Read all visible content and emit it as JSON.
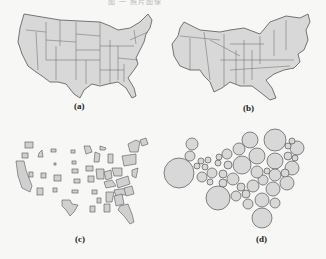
{
  "figure": {
    "caption_fragment": "图 一  照片图像",
    "panels": [
      {
        "id": "a",
        "label": "(a)",
        "description": "Original US state map"
      },
      {
        "id": "b",
        "label": "(b)",
        "description": "Contiguous (diffusion) cartogram"
      },
      {
        "id": "c",
        "label": "(c)",
        "description": "Non-contiguous cartogram"
      },
      {
        "id": "d",
        "label": "(d)",
        "description": "Dorling circle cartogram"
      }
    ]
  },
  "colors": {
    "fill": "#d8d8d8",
    "stroke": "#555555",
    "background": "#f7f7f5"
  },
  "dorling_circles": [
    [
      179,
      173,
      15
    ],
    [
      275,
      140,
      11
    ],
    [
      218,
      198,
      12
    ],
    [
      262,
      218,
      10
    ],
    [
      250,
      140,
      8
    ],
    [
      257,
      156,
      8
    ],
    [
      275,
      161,
      8
    ],
    [
      242,
      165,
      9
    ],
    [
      292,
      168,
      7
    ],
    [
      287,
      183,
      7
    ],
    [
      273,
      189,
      7
    ],
    [
      262,
      200,
      7
    ],
    [
      253,
      186,
      6
    ],
    [
      233,
      179,
      6
    ],
    [
      192,
      144,
      6
    ],
    [
      190,
      156,
      5
    ],
    [
      227,
      154,
      5
    ],
    [
      239,
      149,
      6
    ],
    [
      297,
      148,
      7
    ],
    [
      288,
      156,
      4
    ],
    [
      275,
      175,
      6
    ],
    [
      263,
      180,
      5
    ],
    [
      257,
      172,
      6
    ],
    [
      212,
      173,
      5
    ],
    [
      202,
      177,
      5
    ],
    [
      223,
      183,
      4
    ],
    [
      223,
      174,
      4
    ],
    [
      228,
      165,
      4
    ],
    [
      218,
      163,
      3
    ],
    [
      208,
      160,
      3
    ],
    [
      201,
      161,
      3
    ],
    [
      197,
      166,
      3
    ],
    [
      205,
      167,
      3
    ],
    [
      210,
      182,
      3
    ],
    [
      236,
      196,
      5
    ],
    [
      241,
      187,
      4
    ],
    [
      246,
      194,
      4
    ],
    [
      248,
      204,
      5
    ],
    [
      275,
      203,
      5
    ],
    [
      267,
      171,
      3
    ],
    [
      285,
      173,
      4
    ],
    [
      292,
      141,
      3
    ],
    [
      288,
      146,
      3
    ],
    [
      295,
      158,
      3
    ],
    [
      219,
      157,
      3
    ]
  ]
}
